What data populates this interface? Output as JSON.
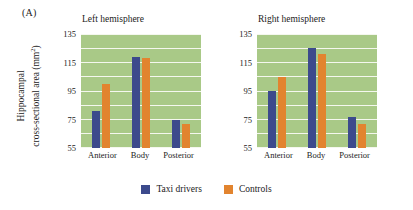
{
  "panel": {
    "label": "(A)"
  },
  "axis_title": {
    "line1": "Hippocampal",
    "line2": "cross-sectional area (mm",
    "superscript": "2",
    "line2_close": ")"
  },
  "legend": {
    "items": [
      {
        "label": "Taxi drivers",
        "color": "#3c4a8c",
        "key": "taxi"
      },
      {
        "label": "Controls",
        "color": "#e2842f",
        "key": "controls"
      }
    ]
  },
  "chart_data": [
    {
      "type": "bar",
      "title": "Left hemisphere",
      "categories": [
        "Anterior",
        "Body",
        "Posterior"
      ],
      "series": [
        {
          "name": "Taxi drivers",
          "color": "#3c4a8c",
          "values": [
            81,
            119,
            75
          ]
        },
        {
          "name": "Controls",
          "color": "#e2842f",
          "values": [
            100,
            118,
            72
          ]
        }
      ],
      "xlabel": "",
      "ylabel": "Hippocampal cross-sectional area (mm2)",
      "ylim": [
        55,
        135
      ],
      "yticks": [
        135,
        115,
        95,
        75,
        55
      ],
      "grid": true,
      "gridline_step": 10,
      "plot_background": "#a9c987",
      "gridline_color": "#f4f7ee",
      "legend_position": "bottom"
    },
    {
      "type": "bar",
      "title": "Right hemisphere",
      "categories": [
        "Anterior",
        "Body",
        "Posterior"
      ],
      "series": [
        {
          "name": "Taxi drivers",
          "color": "#3c4a8c",
          "values": [
            95,
            125,
            77
          ]
        },
        {
          "name": "Controls",
          "color": "#e2842f",
          "values": [
            105,
            121,
            72
          ]
        }
      ],
      "xlabel": "",
      "ylabel": "Hippocampal cross-sectional area (mm2)",
      "ylim": [
        55,
        135
      ],
      "yticks": [
        135,
        115,
        95,
        75,
        55
      ],
      "grid": true,
      "gridline_step": 10,
      "plot_background": "#a9c987",
      "gridline_color": "#f4f7ee",
      "legend_position": "bottom"
    }
  ]
}
